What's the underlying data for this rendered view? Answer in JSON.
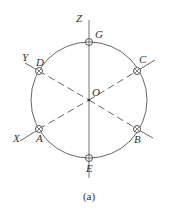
{
  "figure": {
    "caption": "(a)",
    "center": {
      "label": "O",
      "x": 89,
      "y": 100
    },
    "circle": {
      "radius": 58
    },
    "axes": [
      {
        "name": "Z",
        "label": "Z",
        "from": [
          89,
          20
        ],
        "to": [
          89,
          178
        ],
        "style": "solid"
      },
      {
        "name": "Y",
        "label": "Y",
        "from": [
          26,
          63
        ],
        "to": [
          152,
          63
        ],
        "style": "dashed"
      },
      {
        "name": "X",
        "label": "X",
        "from": [
          20,
          139
        ],
        "to": [
          155,
          119
        ],
        "style": "dashed"
      }
    ],
    "points": [
      {
        "label": "G",
        "x": 89,
        "y": 42
      },
      {
        "label": "E",
        "x": 89,
        "y": 158
      },
      {
        "label": "D",
        "x": 39,
        "y": 71
      },
      {
        "label": "C",
        "x": 137,
        "y": 71
      },
      {
        "label": "A",
        "x": 39,
        "y": 129
      },
      {
        "label": "B",
        "x": 137,
        "y": 129
      }
    ],
    "colors": {
      "line": "#555555",
      "text": "#333333",
      "background": "#ffffff"
    }
  }
}
